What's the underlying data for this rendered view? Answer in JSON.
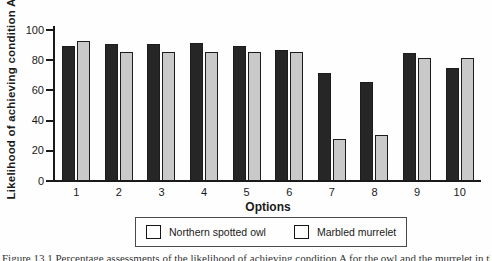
{
  "figure": {
    "y_axis_title": "Likelihood of achieving condition A",
    "x_axis_title": "Options"
  },
  "chart_data": {
    "type": "bar",
    "title": "",
    "xlabel": "Options",
    "ylabel": "Likelihood of achieving condition A",
    "categories": [
      "1",
      "2",
      "3",
      "4",
      "5",
      "6",
      "7",
      "8",
      "9",
      "10"
    ],
    "series": [
      {
        "name": "Northern spotted owl",
        "color": "#262626",
        "values": [
          89,
          90,
          90,
          91,
          89,
          86,
          71,
          65,
          84,
          74
        ]
      },
      {
        "name": "Marbled murrelet",
        "color": "#c9c9c9",
        "values": [
          92,
          85,
          85,
          85,
          85,
          85,
          27,
          30,
          81,
          81
        ]
      }
    ],
    "ylim": [
      0,
      100
    ],
    "y_ticks": [
      0,
      20,
      40,
      60,
      80,
      100
    ],
    "grid": false,
    "legend_position": "bottom"
  },
  "legend": {
    "items": [
      {
        "label": "Northern spotted owl",
        "color": "#262626"
      },
      {
        "label": "Marbled murrelet",
        "color": "#c9c9c9"
      }
    ]
  },
  "caption_fragment": "Figure 13.1  Percentage assessments of the likelihood of achieving condition A for the owl and the murrelet in the Pacific Northwest",
  "colors": {
    "axis": "#1a1a1a",
    "background": "#fefefe",
    "owl_bar": "#262626",
    "murrelet_bar": "#c9c9c9",
    "legend_border": "#4a4a4a"
  }
}
